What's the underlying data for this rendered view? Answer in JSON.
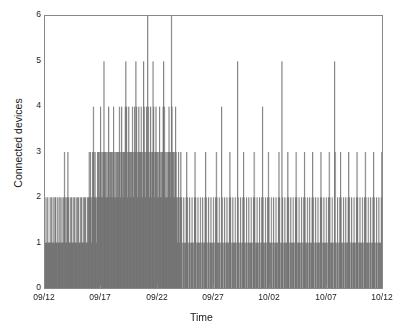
{
  "chart_data": {
    "type": "bar",
    "title": "",
    "subtitle": "",
    "xlabel": "Time",
    "ylabel": "Connected devices",
    "xlim": [
      "09/12",
      "10/13"
    ],
    "ylim": [
      0,
      6
    ],
    "y_ticks": [
      0,
      1,
      2,
      3,
      4,
      5,
      6
    ],
    "y_tick_labels": [
      "0",
      "1",
      "2",
      "3",
      "4",
      "5",
      "6"
    ],
    "x_ticks": [
      "09/12",
      "09/17",
      "09/22",
      "09/27",
      "10/02",
      "10/07",
      "10/12"
    ],
    "x_tick_labels": [
      "09/12",
      "09/17",
      "09/22",
      "09/27",
      "10/02",
      "10/07",
      "10/12"
    ],
    "grid": false,
    "legend": null,
    "bar_color": "#5f5f5f",
    "background_color": "#ffffff",
    "axis_color": "#888888",
    "series": [
      {
        "name": "Connected devices",
        "note": "High-resolution sampling of connected device count; one value per sample bar.",
        "values": [
          1,
          2,
          1,
          1,
          2,
          1,
          1,
          1,
          2,
          1,
          2,
          1,
          1,
          2,
          1,
          1,
          2,
          2,
          1,
          1,
          2,
          1,
          1,
          2,
          1,
          2,
          1,
          1,
          2,
          1,
          1,
          2,
          3,
          2,
          1,
          2,
          1,
          2,
          3,
          2,
          1,
          1,
          2,
          1,
          2,
          1,
          1,
          2,
          1,
          2,
          1,
          1,
          2,
          1,
          2,
          1,
          2,
          1,
          1,
          2,
          1,
          2,
          1,
          1,
          2,
          1,
          2,
          1,
          2,
          1,
          1,
          2,
          1,
          2,
          3,
          2,
          3,
          2,
          1,
          2,
          3,
          4,
          3,
          2,
          3,
          2,
          1,
          2,
          3,
          2,
          3,
          2,
          3,
          4,
          3,
          2,
          3,
          2,
          3,
          5,
          3,
          2,
          3,
          2,
          3,
          2,
          3,
          4,
          3,
          2,
          3,
          2,
          3,
          2,
          3,
          4,
          3,
          2,
          3,
          2,
          3,
          2,
          3,
          2,
          3,
          4,
          3,
          2,
          3,
          4,
          3,
          2,
          3,
          2,
          3,
          4,
          5,
          4,
          3,
          2,
          3,
          4,
          3,
          2,
          3,
          2,
          3,
          4,
          3,
          2,
          3,
          4,
          3,
          5,
          4,
          3,
          2,
          3,
          4,
          3,
          2,
          3,
          4,
          3,
          2,
          3,
          5,
          4,
          3,
          2,
          3,
          4,
          3,
          6,
          4,
          3,
          2,
          3,
          4,
          3,
          2,
          3,
          5,
          4,
          3,
          2,
          3,
          4,
          3,
          2,
          3,
          2,
          3,
          4,
          3,
          2,
          3,
          2,
          3,
          4,
          5,
          4,
          3,
          2,
          3,
          2,
          3,
          2,
          3,
          4,
          3,
          2,
          3,
          6,
          4,
          3,
          2,
          3,
          2,
          3,
          4,
          3,
          2,
          1,
          2,
          3,
          2,
          1,
          2,
          3,
          2,
          1,
          0,
          1,
          2,
          1,
          0,
          1,
          2,
          3,
          2,
          1,
          0,
          1,
          2,
          1,
          0,
          1,
          2,
          1,
          0,
          1,
          2,
          3,
          2,
          1,
          0,
          1,
          2,
          1,
          0,
          1,
          2,
          1,
          0,
          1,
          2,
          1,
          0,
          1,
          2,
          3,
          2,
          1,
          0,
          1,
          2,
          1,
          0,
          1,
          2,
          1,
          0,
          1,
          2,
          1,
          0,
          1,
          2,
          3,
          2,
          1,
          0,
          1,
          2,
          1,
          0,
          1,
          4,
          2,
          1,
          0,
          1,
          2,
          1,
          0,
          1,
          2,
          1,
          0,
          1,
          2,
          3,
          2,
          1,
          0,
          1,
          2,
          1,
          0,
          1,
          2,
          1,
          0,
          1,
          5,
          2,
          1,
          0,
          1,
          2,
          1,
          0,
          1,
          2,
          3,
          2,
          1,
          0,
          1,
          2,
          1,
          0,
          1,
          2,
          1,
          0,
          1,
          2,
          1,
          0,
          1,
          2,
          3,
          2,
          1,
          0,
          1,
          2,
          1,
          0,
          1,
          2,
          1,
          0,
          1,
          2,
          4,
          2,
          1,
          0,
          1,
          2,
          1,
          0,
          1,
          2,
          3,
          2,
          1,
          0,
          1,
          2,
          1,
          0,
          1,
          2,
          1,
          0,
          1,
          2,
          1,
          0,
          1,
          2,
          3,
          2,
          1,
          0,
          1,
          5,
          2,
          1,
          0,
          1,
          2,
          1,
          0,
          1,
          2,
          3,
          2,
          1,
          0,
          1,
          2,
          1,
          0,
          1,
          2,
          1,
          0,
          1,
          2,
          3,
          2,
          1,
          0,
          1,
          2,
          1,
          0,
          1,
          2,
          1,
          0,
          1,
          2,
          3,
          2,
          1,
          0,
          1,
          2,
          1,
          0,
          1,
          2,
          1,
          0,
          1,
          2,
          3,
          2,
          1,
          0,
          1,
          2,
          1,
          0,
          1,
          2,
          1,
          0,
          1,
          2,
          3,
          2,
          1,
          0,
          1,
          2,
          1,
          0,
          1,
          2,
          1,
          0,
          1,
          2,
          3,
          2,
          1,
          0,
          1,
          2,
          1,
          0,
          1,
          5,
          3,
          1,
          0,
          1,
          2,
          1,
          0,
          1,
          2,
          3,
          2,
          1,
          0,
          1,
          2,
          1,
          0,
          1,
          2,
          1,
          0,
          1,
          2,
          3,
          2,
          1,
          0,
          1,
          2,
          1,
          0,
          1,
          2,
          1,
          0,
          1,
          2,
          3,
          2,
          1,
          0,
          1,
          2,
          1,
          0,
          1,
          2,
          1,
          0,
          1,
          2,
          3,
          2,
          1,
          0,
          1,
          2,
          1,
          0,
          1,
          2,
          1,
          0,
          1,
          2,
          3,
          2,
          1,
          0,
          1,
          2,
          1,
          0,
          1,
          2,
          1,
          0,
          1,
          2,
          3
        ]
      }
    ]
  },
  "axes": {
    "y_title": "Connected devices",
    "x_title": "Time"
  }
}
